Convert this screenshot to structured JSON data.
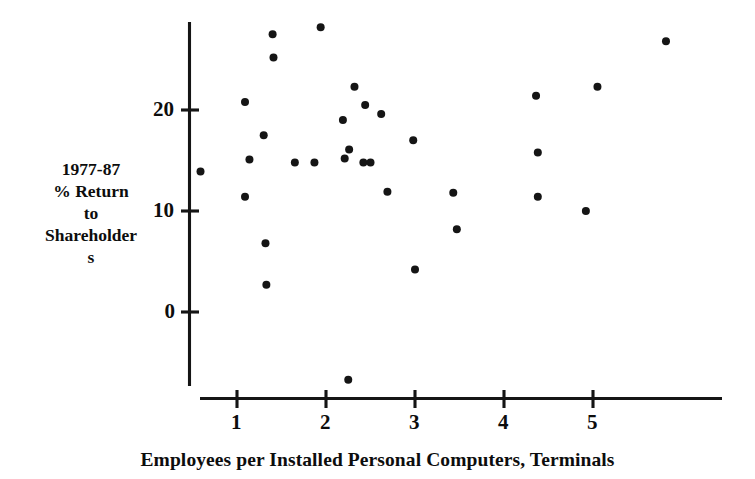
{
  "chart_data": {
    "type": "scatter",
    "title": "",
    "xlabel": "Employees per Installed Personal Computers, Terminals",
    "ylabel": "1977-87 % Return to Shareholders",
    "ylabel_lines": [
      "1977-87",
      "% Return",
      "to",
      "Shareholder",
      "s"
    ],
    "xticks": [
      1,
      2,
      3,
      4,
      5
    ],
    "xtick_labels": [
      "1",
      "2",
      "3",
      "4",
      "5"
    ],
    "yticks": [
      0,
      10,
      20
    ],
    "ytick_labels": [
      "0",
      "10",
      "20"
    ],
    "xlim": [
      0.58,
      6.05
    ],
    "ylim": [
      -8.6,
      29.4
    ],
    "grid": false,
    "legend": null,
    "marker": "filled-circle",
    "marker_color": "#151515",
    "points": [
      {
        "x": 0.59,
        "y": 13.9
      },
      {
        "x": 1.09,
        "y": 20.8
      },
      {
        "x": 1.09,
        "y": 11.4
      },
      {
        "x": 1.14,
        "y": 15.1
      },
      {
        "x": 1.3,
        "y": 17.5
      },
      {
        "x": 1.32,
        "y": 6.8
      },
      {
        "x": 1.33,
        "y": 2.7
      },
      {
        "x": 1.41,
        "y": 25.2
      },
      {
        "x": 1.4,
        "y": 27.5
      },
      {
        "x": 1.65,
        "y": 14.8
      },
      {
        "x": 1.87,
        "y": 14.8
      },
      {
        "x": 1.94,
        "y": 28.2
      },
      {
        "x": 2.25,
        "y": -6.7
      },
      {
        "x": 2.19,
        "y": 19.0
      },
      {
        "x": 2.21,
        "y": 15.2
      },
      {
        "x": 2.26,
        "y": 16.1
      },
      {
        "x": 2.32,
        "y": 22.3
      },
      {
        "x": 2.42,
        "y": 14.8
      },
      {
        "x": 2.5,
        "y": 14.8
      },
      {
        "x": 2.44,
        "y": 20.5
      },
      {
        "x": 2.62,
        "y": 19.6
      },
      {
        "x": 2.69,
        "y": 11.9
      },
      {
        "x": 2.98,
        "y": 17.0
      },
      {
        "x": 3.0,
        "y": 4.2
      },
      {
        "x": 3.43,
        "y": 11.8
      },
      {
        "x": 3.47,
        "y": 8.2
      },
      {
        "x": 4.36,
        "y": 21.4
      },
      {
        "x": 4.38,
        "y": 15.8
      },
      {
        "x": 4.38,
        "y": 11.4
      },
      {
        "x": 4.92,
        "y": 10.0
      },
      {
        "x": 5.05,
        "y": 22.3
      },
      {
        "x": 5.82,
        "y": 26.8
      }
    ]
  },
  "axes": {
    "x_axis_label": "Employees per Installed Personal Computers, Terminals"
  }
}
